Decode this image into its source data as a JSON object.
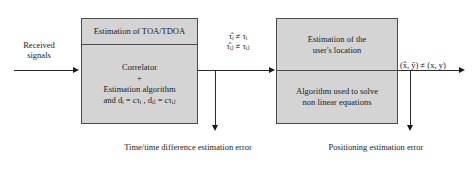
{
  "diagram": {
    "input_label": "Received\nsignals",
    "input_line1": "Received",
    "input_line2": "signals",
    "left_box": {
      "header": "Estimation of TOA/TDOA",
      "body_line1": "Correlator",
      "body_plus": "+",
      "body_line2": "Estimation algorithm",
      "body_formula_prefix": "and ",
      "body_formula": "and dᵢ = cτᵢ , dᵢⱼ = cτᵢⱼ"
    },
    "right_box": {
      "header_line1": "Estimation of the",
      "header_line2": "user's location",
      "body_line1": "Algorithm used to solve",
      "body_line2": "non linear equations"
    },
    "mid_label": {
      "line1": "τ̂ᵢ ≠ τᵢ",
      "line2": "τ̂ᵢⱼ ≠ τᵢⱼ"
    },
    "output_label": "(x̂, ŷ) ≠ (x, y)",
    "caption_left": "Time/time difference estimation error",
    "caption_right": "Positioning estimation error",
    "colors": {
      "box_fill": "#d4d4d4",
      "box_border": "#4a4a4a",
      "line": "#2b2b2b",
      "text": "#1a1a1a",
      "background": "#ffffff"
    }
  }
}
